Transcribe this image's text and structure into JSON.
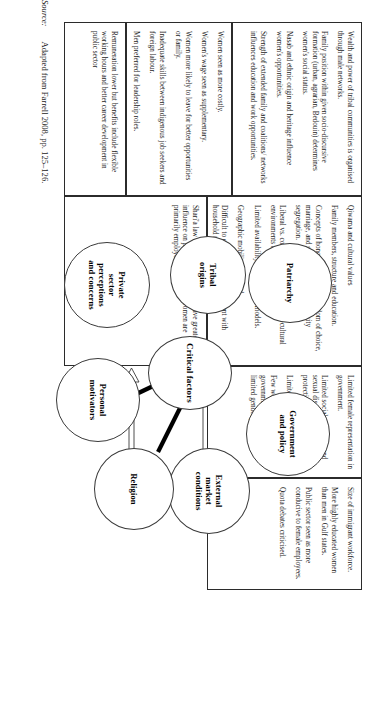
{
  "figure": {
    "center_node": "Critical factors",
    "source_label": "Source:",
    "source_text": "Adapted from Farrell 2008, pp. 125–126."
  },
  "nodes": [
    {
      "id": "tribal",
      "label": "Tribal\norigins"
    },
    {
      "id": "patriarchy",
      "label": "Patriarchy"
    },
    {
      "id": "government",
      "label": "Government\nand policy"
    },
    {
      "id": "external",
      "label": "External\nmarket\nconditions"
    },
    {
      "id": "religion",
      "label": "Religion"
    },
    {
      "id": "personal",
      "label": "Personal\nmotivators"
    },
    {
      "id": "private",
      "label": "Private\nsector\nperceptions\nand concerns"
    }
  ],
  "boxes": [
    {
      "id": "box-tribal",
      "for": "tribal",
      "lines": [
        "Wealth and power of tribal communities is organised through male networks.",
        "Family position within given socio-discursive formation (urban, agrarian, Bedouin) determines women's social status.",
        "Nasab and ethnic origin and heritage influence women's opportunities.",
        "Strength of extended family and coalitions/ networks influences education and work opportunities."
      ]
    },
    {
      "id": "box-patriarchy",
      "for": "patriarchy",
      "lines": [
        "Qiwama and cultural values",
        "Family members, structure and education.",
        "Concepts of honour and power: freedom of choice, marriage, and seclusion ethics and activity segregation.",
        "Liberal vs. conservative; views on multi-cultural environments and female employment.",
        "Limited availability of female role models.",
        "Geographic mobility restricted.",
        "Difficult to combine paid employment with household responsibilities."
      ]
    },
    {
      "id": "box-government",
      "for": "government",
      "lines": [
        "Limited female representation in government.",
        "Limited social protection and sexual discrimination protection.",
        "Limited childcare.",
        "Few women's councils in government machinery and limited gender planning."
      ]
    },
    {
      "id": "box-external",
      "for": "external",
      "lines": [
        "Size of immigrant workforce.",
        "More highly educated women than men in Gulf states.",
        "Public sector seen as more conducive to female employees.",
        "Quota debates criticised."
      ]
    },
    {
      "id": "box-religion",
      "for": "religion",
      "lines": [
        "Shari'a law and clerical authorities have greater influence on public sector where women are primarily employed."
      ]
    },
    {
      "id": "box-personal",
      "for": "personal",
      "lines": [
        "Remuneration lower but benefits include flexible working hours and better career development in public sector"
      ]
    },
    {
      "id": "box-private",
      "for": "private",
      "lines": [
        "Women seen as more costly.",
        "Women's wage seen as supplementary.",
        "Women more likely to leave for better opportunities or family.",
        "Inadequate skills between indigenous job seekers and foreign labour.",
        "Men preferred for leadership roles."
      ]
    }
  ]
}
